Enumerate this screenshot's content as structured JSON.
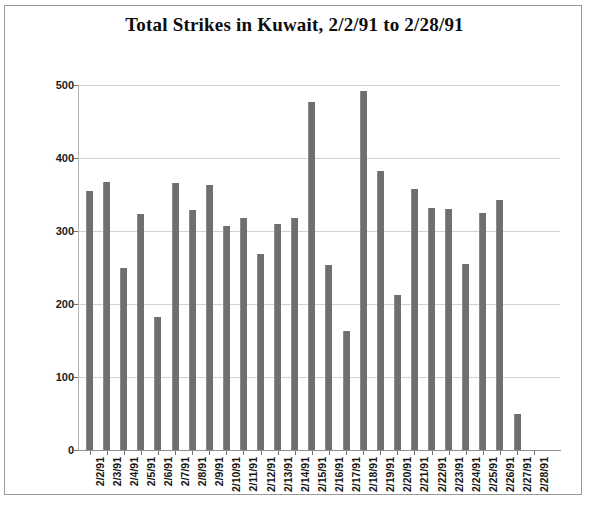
{
  "chart_data": {
    "type": "bar",
    "title": "Total Strikes in Kuwait, 2/2/91 to 2/28/91",
    "xlabel": "",
    "ylabel": "",
    "ylim": [
      0,
      500
    ],
    "yticks": [
      0,
      100,
      200,
      300,
      400,
      500
    ],
    "grid": true,
    "legend": null,
    "bar_color": "#6f6f6f",
    "categories": [
      "2/2/91",
      "2/3/91",
      "2/4/91",
      "2/5/91",
      "2/6/91",
      "2/7/91",
      "2/8/91",
      "2/9/91",
      "2/10/91",
      "2/11/91",
      "2/12/91",
      "2/13/91",
      "2/14/91",
      "2/15/91",
      "2/16/91",
      "2/17/91",
      "2/18/91",
      "2/19/91",
      "2/20/91",
      "2/21/91",
      "2/22/91",
      "2/23/91",
      "2/24/91",
      "2/25/91",
      "2/26/91",
      "2/27/91",
      "2/28/91"
    ],
    "values": [
      355,
      367,
      250,
      323,
      182,
      366,
      329,
      363,
      307,
      318,
      268,
      309,
      318,
      477,
      254,
      163,
      492,
      382,
      213,
      357,
      331,
      330,
      255,
      325,
      343,
      50,
      0
    ]
  },
  "caption": {
    "text": ""
  }
}
